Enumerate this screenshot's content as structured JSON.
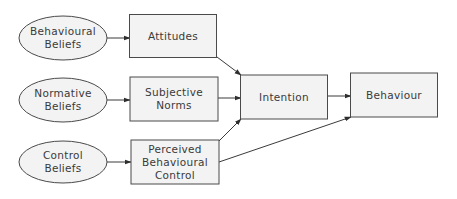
{
  "diagram": {
    "type": "flow",
    "nodes": [
      {
        "id": "behavioural_beliefs",
        "shape": "ellipse",
        "lines": [
          "Behavioural",
          "Beliefs"
        ]
      },
      {
        "id": "normative_beliefs",
        "shape": "ellipse",
        "lines": [
          "Normative",
          "Beliefs"
        ]
      },
      {
        "id": "control_beliefs",
        "shape": "ellipse",
        "lines": [
          "Control",
          "Beliefs"
        ]
      },
      {
        "id": "attitudes",
        "shape": "rect",
        "lines": [
          "Attitudes"
        ]
      },
      {
        "id": "subjective_norms",
        "shape": "rect",
        "lines": [
          "Subjective",
          "Norms"
        ]
      },
      {
        "id": "perceived_behavioural_control",
        "shape": "rect",
        "lines": [
          "Perceived",
          "Behavioural",
          "Control"
        ]
      },
      {
        "id": "intention",
        "shape": "rect",
        "lines": [
          "Intention"
        ]
      },
      {
        "id": "behaviour",
        "shape": "rect",
        "lines": [
          "Behaviour"
        ]
      }
    ],
    "edges": [
      {
        "from": "behavioural_beliefs",
        "to": "attitudes"
      },
      {
        "from": "normative_beliefs",
        "to": "subjective_norms"
      },
      {
        "from": "control_beliefs",
        "to": "perceived_behavioural_control"
      },
      {
        "from": "attitudes",
        "to": "intention"
      },
      {
        "from": "subjective_norms",
        "to": "intention"
      },
      {
        "from": "perceived_behavioural_control",
        "to": "intention"
      },
      {
        "from": "intention",
        "to": "behaviour"
      },
      {
        "from": "perceived_behavioural_control",
        "to": "behaviour"
      }
    ]
  },
  "colors": {
    "node_fill": "#f3f3f3",
    "node_stroke": "#4a4a4a",
    "text": "#3a3a3a",
    "edge": "#3a3a3a"
  }
}
